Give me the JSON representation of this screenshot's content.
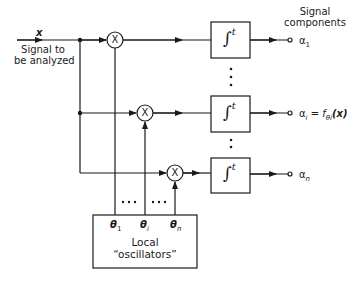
{
  "diagram": {
    "input": {
      "symbol": "x",
      "label_line1": "Signal to",
      "label_line2": "be analyzed"
    },
    "output_header": {
      "line1": "Signal",
      "line2": "components"
    },
    "multiplier_symbol": "X",
    "integrator_symbol": "∫",
    "integrator_superscript": "t",
    "channels": [
      {
        "id": "1",
        "output_label": "α",
        "output_sub": "1",
        "output_extra": "",
        "theta_label": "θ",
        "theta_sub": "1"
      },
      {
        "id": "i",
        "output_label": "α",
        "output_sub": "i",
        "output_extra": " = f",
        "output_extra_sub": "θi",
        "output_arg": "(x)",
        "theta_label": "θ",
        "theta_sub": "i"
      },
      {
        "id": "n",
        "output_label": "α",
        "output_sub": "n",
        "output_extra": "",
        "theta_label": "θ",
        "theta_sub": "n"
      }
    ],
    "ellipsis": "•••",
    "oscillator_box": {
      "line1": "Local",
      "line2": "“oscillators”"
    },
    "colors": {
      "line": "#1a1a1a",
      "background": "#ffffff"
    }
  }
}
